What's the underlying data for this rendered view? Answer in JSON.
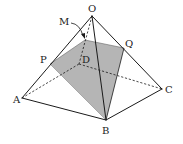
{
  "diagram": {
    "colors": {
      "stroke": "#1a1a1a",
      "section_fill": "#b5b5b5",
      "background": "#ffffff"
    },
    "vertices": {
      "O": {
        "x": 92,
        "y": 16
      },
      "A": {
        "x": 22,
        "y": 98
      },
      "B": {
        "x": 106,
        "y": 120
      },
      "C": {
        "x": 162,
        "y": 89
      },
      "D": {
        "x": 79,
        "y": 64
      },
      "P": {
        "x": 50,
        "y": 64
      },
      "Q": {
        "x": 124,
        "y": 48
      },
      "M": {
        "x": 85,
        "y": 40
      }
    },
    "labels": {
      "O": "O",
      "A": "A",
      "B": "B",
      "C": "C",
      "D": "D",
      "P": "P",
      "Q": "Q",
      "M": "M"
    },
    "solid_edges": [
      "OA",
      "OB",
      "OC",
      "AB",
      "BC"
    ],
    "hidden_edges": [
      "OD",
      "AD",
      "DC"
    ],
    "section": [
      "P",
      "M",
      "Q",
      "B"
    ]
  }
}
